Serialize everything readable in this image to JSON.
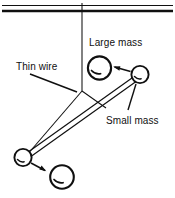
{
  "figure": {
    "background_color": "#ffffff",
    "ink_color": "#101010",
    "labels": {
      "large_mass": "Large mass",
      "thin_wire": "Thin wire",
      "small_mass": "Small mass"
    },
    "parts": {
      "ceiling": "ceiling-support-bar",
      "wire": "suspension-thin-wire",
      "fork": "wire-fork-junction",
      "rod": "horizontal-connecting-rod",
      "upper_small_ball": "small-mass-upper-right",
      "upper_large_ball": "large-mass-upper-left",
      "lower_small_ball": "small-mass-lower-left",
      "lower_large_ball": "large-mass-lower-right",
      "upper_arrow": "attraction-arrow-upper",
      "lower_arrow": "attraction-arrow-lower"
    },
    "geometry": {
      "ceiling_y": 8,
      "wire_x": 82,
      "fork_y": 91,
      "rod_from": [
        139,
        76
      ],
      "rod_to": [
        25,
        158
      ],
      "large_ball_radius": 11.5,
      "small_ball_radius": 8.5
    }
  }
}
